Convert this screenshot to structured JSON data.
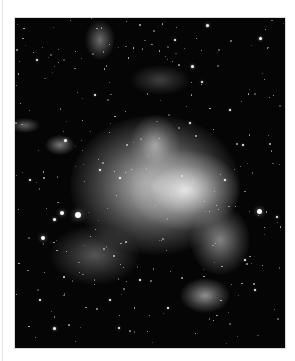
{
  "image": {
    "subject": "irregular galaxy with star field",
    "colors": {
      "background": "#ffffff",
      "sky": "#050505",
      "core": "#e8e8e8"
    },
    "glows": [
      {
        "x": 155,
        "y": 185,
        "w": 170,
        "h": 140,
        "opacity": 0.85
      },
      {
        "x": 185,
        "y": 190,
        "w": 110,
        "h": 80,
        "opacity": 0.95
      },
      {
        "x": 155,
        "y": 145,
        "w": 50,
        "h": 60,
        "opacity": 0.55
      },
      {
        "x": 220,
        "y": 240,
        "w": 60,
        "h": 70,
        "opacity": 0.55
      },
      {
        "x": 205,
        "y": 295,
        "w": 50,
        "h": 35,
        "opacity": 0.6
      },
      {
        "x": 100,
        "y": 40,
        "w": 30,
        "h": 40,
        "opacity": 0.45
      },
      {
        "x": 60,
        "y": 145,
        "w": 30,
        "h": 20,
        "opacity": 0.5
      },
      {
        "x": 25,
        "y": 125,
        "w": 30,
        "h": 15,
        "opacity": 0.4
      },
      {
        "x": 95,
        "y": 255,
        "w": 90,
        "h": 60,
        "opacity": 0.35
      },
      {
        "x": 160,
        "y": 80,
        "w": 60,
        "h": 30,
        "opacity": 0.25
      }
    ],
    "stars": [
      {
        "x": 78,
        "y": 215,
        "r": 3
      },
      {
        "x": 62,
        "y": 213,
        "r": 2
      },
      {
        "x": 54,
        "y": 219,
        "r": 1.5
      },
      {
        "x": 259,
        "y": 211,
        "r": 2.5
      },
      {
        "x": 207,
        "y": 25,
        "r": 1.5
      },
      {
        "x": 260,
        "y": 38,
        "r": 1.5
      },
      {
        "x": 192,
        "y": 66,
        "r": 1.5
      },
      {
        "x": 37,
        "y": 60,
        "r": 1.2
      },
      {
        "x": 202,
        "y": 82,
        "r": 1.2
      },
      {
        "x": 54,
        "y": 328,
        "r": 1.5
      },
      {
        "x": 119,
        "y": 328,
        "r": 1.2
      },
      {
        "x": 43,
        "y": 238,
        "r": 2
      },
      {
        "x": 277,
        "y": 217,
        "r": 1.2
      },
      {
        "x": 168,
        "y": 308,
        "r": 1.2
      },
      {
        "x": 100,
        "y": 170,
        "r": 1
      },
      {
        "x": 190,
        "y": 123,
        "r": 1.2
      },
      {
        "x": 243,
        "y": 145,
        "r": 1
      },
      {
        "x": 120,
        "y": 178,
        "r": 1
      },
      {
        "x": 150,
        "y": 12,
        "r": 1
      },
      {
        "x": 40,
        "y": 300,
        "r": 1
      },
      {
        "x": 30,
        "y": 180,
        "r": 1
      },
      {
        "x": 255,
        "y": 290,
        "r": 1
      },
      {
        "x": 140,
        "y": 280,
        "r": 1
      },
      {
        "x": 65,
        "y": 140,
        "r": 1.5
      },
      {
        "x": 225,
        "y": 180,
        "r": 1
      },
      {
        "x": 245,
        "y": 260,
        "r": 1
      },
      {
        "x": 95,
        "y": 95,
        "r": 1
      },
      {
        "x": 175,
        "y": 40,
        "r": 1
      },
      {
        "x": 230,
        "y": 110,
        "r": 1
      },
      {
        "x": 110,
        "y": 300,
        "r": 1
      }
    ]
  }
}
